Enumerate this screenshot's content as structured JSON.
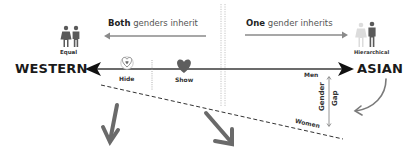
{
  "diagram": {
    "top_left_caption": {
      "bold": "Both",
      "rest": " genders inherit"
    },
    "top_right_caption": {
      "bold": "One",
      "rest": " gender inherits"
    },
    "left_pole": "WESTERN",
    "right_pole": "ASIAN",
    "left_icon": {
      "name": "equal-people-icon",
      "label": "Equal"
    },
    "right_icon": {
      "name": "hierarchical-people-icon",
      "label": "Hierarchical"
    },
    "hearts": [
      {
        "name": "hide-heart-icon",
        "style": "outline",
        "label": "Hide"
      },
      {
        "name": "show-heart-icon",
        "style": "filled",
        "label": "Show"
      }
    ],
    "gap": {
      "top_label": "Men",
      "bottom_label": "Women",
      "axis_label_1": "Gender",
      "axis_label_2": "Gap"
    },
    "colors": {
      "dark": "#1a1a1a",
      "gray": "#6e6e6e",
      "light_gray": "#c9c9c9",
      "arrow_gray": "#777777"
    }
  }
}
